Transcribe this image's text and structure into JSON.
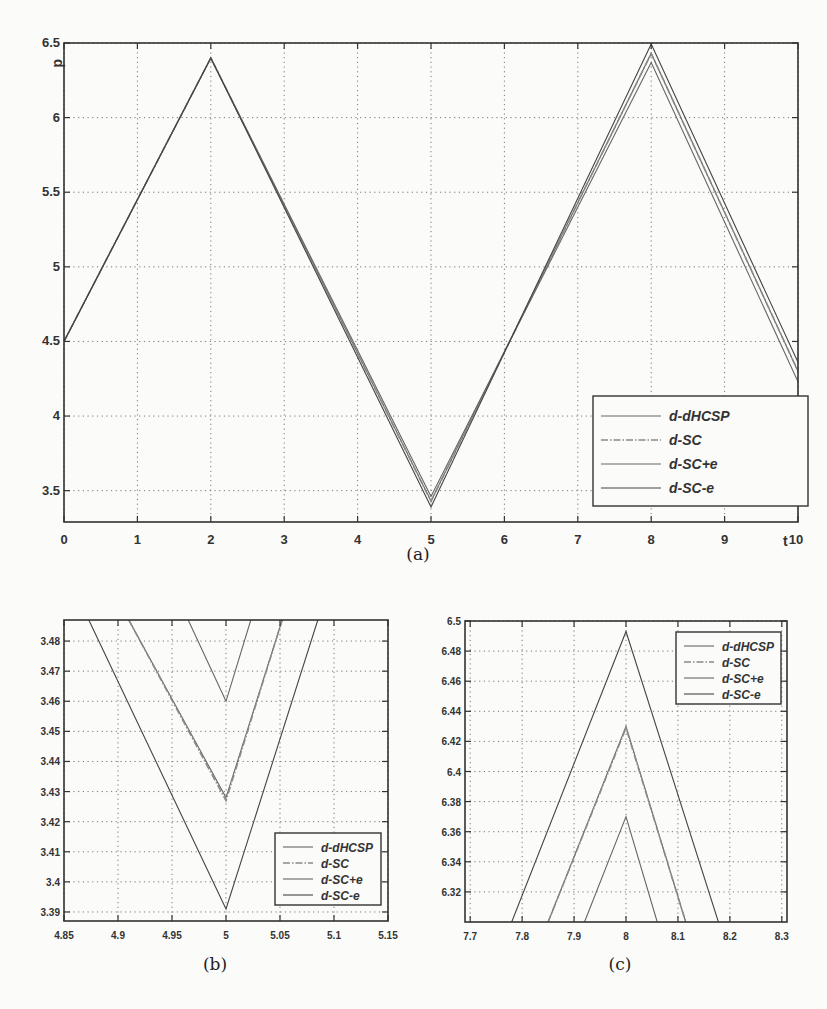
{
  "chart_data": [
    {
      "id": "a",
      "type": "line",
      "caption": "(a)",
      "xlabel": "t",
      "ylabel": "d",
      "xlim": [
        0,
        10
      ],
      "ylim": [
        3.29,
        6.5
      ],
      "xticks": [
        0,
        1,
        2,
        3,
        4,
        5,
        6,
        7,
        8,
        9,
        10
      ],
      "yticks": [
        3.5,
        4,
        4.5,
        5,
        5.5,
        6,
        6.5
      ],
      "grid": true,
      "legend_position": "lower right",
      "series": [
        {
          "name": "d-dHCSP",
          "style": "solid",
          "x": [
            0,
            2,
            5,
            8,
            10
          ],
          "y": [
            4.5,
            6.4,
            3.43,
            6.43,
            4.3
          ]
        },
        {
          "name": "d-SC",
          "style": "dashdot",
          "x": [
            0,
            2,
            5,
            8,
            10
          ],
          "y": [
            4.5,
            6.4,
            3.428,
            6.43,
            4.3
          ]
        },
        {
          "name": "d-SC+e",
          "style": "solid",
          "x": [
            0,
            2,
            5,
            8,
            10
          ],
          "y": [
            4.5,
            6.4,
            3.46,
            6.37,
            4.23
          ]
        },
        {
          "name": "d-SC-e",
          "style": "solid",
          "x": [
            0,
            2,
            5,
            8,
            10
          ],
          "y": [
            4.5,
            6.4,
            3.391,
            6.493,
            4.36
          ]
        }
      ]
    },
    {
      "id": "b",
      "type": "line",
      "caption": "(b)",
      "xlim": [
        4.85,
        5.15
      ],
      "ylim": [
        3.387,
        3.487
      ],
      "xticks": [
        4.85,
        4.9,
        4.95,
        5,
        5.05,
        5.1,
        5.15
      ],
      "yticks": [
        3.39,
        3.4,
        3.41,
        3.42,
        3.43,
        3.44,
        3.45,
        3.46,
        3.47,
        3.48
      ],
      "grid": true,
      "legend_position": "lower right",
      "series": [
        {
          "name": "d-dHCSP",
          "style": "solid",
          "x": [
            4.91,
            5,
            5.052
          ],
          "y": [
            3.487,
            3.428,
            3.487
          ]
        },
        {
          "name": "d-SC",
          "style": "dashdot",
          "x": [
            4.91,
            5,
            5.052
          ],
          "y": [
            3.487,
            3.427,
            3.487
          ]
        },
        {
          "name": "d-SC+e",
          "style": "solid",
          "x": [
            4.965,
            5,
            5.023
          ],
          "y": [
            3.487,
            3.46,
            3.487
          ]
        },
        {
          "name": "d-SC-e",
          "style": "solid",
          "x": [
            4.873,
            5,
            5.085
          ],
          "y": [
            3.487,
            3.391,
            3.487
          ]
        }
      ]
    },
    {
      "id": "c",
      "type": "line",
      "caption": "(c)",
      "xlim": [
        7.69,
        8.31
      ],
      "ylim": [
        6.3,
        6.5
      ],
      "xticks": [
        7.7,
        7.8,
        7.9,
        8,
        8.1,
        8.2,
        8.3
      ],
      "yticks": [
        6.32,
        6.34,
        6.36,
        6.38,
        6.4,
        6.42,
        6.44,
        6.46,
        6.48,
        6.5
      ],
      "grid": true,
      "legend_position": "upper right",
      "series": [
        {
          "name": "d-dHCSP",
          "style": "solid",
          "x": [
            7.85,
            8,
            8.115
          ],
          "y": [
            6.3,
            6.43,
            6.3
          ]
        },
        {
          "name": "d-SC",
          "style": "dashdot",
          "x": [
            7.85,
            8,
            8.115
          ],
          "y": [
            6.3,
            6.429,
            6.3
          ]
        },
        {
          "name": "d-SC+e",
          "style": "solid",
          "x": [
            7.92,
            8,
            8.06
          ],
          "y": [
            6.3,
            6.37,
            6.3
          ]
        },
        {
          "name": "d-SC-e",
          "style": "solid",
          "x": [
            7.78,
            8,
            8.178
          ],
          "y": [
            6.3,
            6.493,
            6.3
          ]
        }
      ]
    }
  ],
  "legend_labels": [
    "d-dHCSP",
    "d-SC",
    "d-SC+e",
    "d-SC-e"
  ],
  "colors": {
    "axis": "#333333",
    "grid": "#777777",
    "line": "#666666",
    "line_dark": "#444444",
    "dashdot": "#8a8a8a"
  }
}
